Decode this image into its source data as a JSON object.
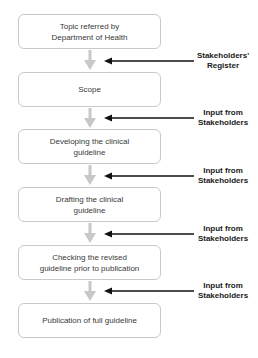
{
  "diagram": {
    "type": "flowchart",
    "colors": {
      "box_border": "#c9c9c9",
      "box_text": "#3a3a3a",
      "connector": "#c8c8c8",
      "input_arrow": "#111111",
      "input_label": "#1a1a1a"
    },
    "steps": [
      {
        "id": "topic",
        "label_line1": "Topic referred by",
        "label_line2": "Department of Health"
      },
      {
        "id": "scope",
        "label_line1": "Scope",
        "label_line2": ""
      },
      {
        "id": "developing",
        "label_line1": "Developing the clinical",
        "label_line2": "guideline"
      },
      {
        "id": "drafting",
        "label_line1": "Drafting the clinical",
        "label_line2": "guideline"
      },
      {
        "id": "checking",
        "label_line1": "Checking the revised",
        "label_line2": "guideline prior to publication"
      },
      {
        "id": "publication",
        "label_line1": "Publication of full guideline",
        "label_line2": ""
      }
    ],
    "inputs": [
      {
        "after_step": "topic",
        "label_line1": "Stakeholders'",
        "label_line2": "Register"
      },
      {
        "after_step": "scope",
        "label_line1": "Input from",
        "label_line2": "Stakeholders"
      },
      {
        "after_step": "developing",
        "label_line1": "Input from",
        "label_line2": "Stakeholders"
      },
      {
        "after_step": "drafting",
        "label_line1": "Input from",
        "label_line2": "Stakeholders"
      },
      {
        "after_step": "checking",
        "label_line1": "Input from",
        "label_line2": "Stakeholders"
      }
    ]
  }
}
